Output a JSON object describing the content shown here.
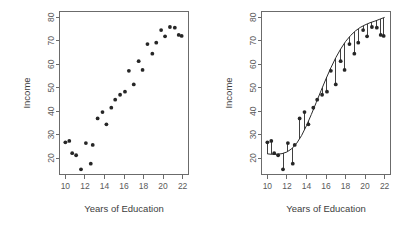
{
  "figure": {
    "background_color": "#ffffff",
    "point_color": "#262626",
    "curve_color": "#2b2b2b",
    "axis_color": "#6b6b6b",
    "label_color": "#3d3d3d"
  },
  "chart_data": [
    {
      "id": "left",
      "type": "scatter",
      "title": "",
      "xlabel": "Years of Education",
      "ylabel": "Income",
      "xlim": [
        9.4,
        22.6
      ],
      "ylim": [
        13.0,
        82.5
      ],
      "xticks": [
        10,
        12,
        14,
        16,
        18,
        20,
        22
      ],
      "yticks": [
        20,
        30,
        40,
        50,
        60,
        70,
        80
      ],
      "grid": false,
      "legend": "none",
      "x": [
        10.0,
        10.4,
        10.7,
        11.1,
        11.6,
        12.1,
        12.6,
        12.8,
        13.3,
        13.8,
        14.2,
        14.7,
        15.1,
        15.6,
        16.1,
        16.5,
        17.0,
        17.5,
        17.9,
        18.4,
        18.9,
        19.3,
        19.8,
        20.2,
        20.7,
        21.2,
        21.6,
        21.9
      ],
      "y": [
        26.7,
        27.3,
        22.1,
        21.2,
        15.2,
        26.4,
        17.6,
        25.6,
        36.9,
        39.6,
        34.4,
        41.5,
        44.9,
        47.0,
        48.3,
        57.2,
        51.4,
        61.3,
        57.6,
        68.6,
        64.5,
        69.2,
        74.6,
        71.9,
        75.9,
        75.6,
        72.5,
        72.1
      ],
      "note": "ISLR Income dataset: Income vs Years of Education"
    },
    {
      "id": "right",
      "type": "scatter",
      "title": "",
      "xlabel": "Years of Education",
      "ylabel": "Income",
      "xlim": [
        9.4,
        22.6
      ],
      "ylim": [
        13.0,
        82.5
      ],
      "xticks": [
        10,
        12,
        14,
        16,
        18,
        20,
        22
      ],
      "yticks": [
        20,
        30,
        40,
        50,
        60,
        70,
        80
      ],
      "grid": false,
      "legend": "none",
      "x": [
        10.0,
        10.4,
        10.7,
        11.1,
        11.6,
        12.1,
        12.6,
        12.8,
        13.3,
        13.8,
        14.2,
        14.7,
        15.1,
        15.6,
        16.1,
        16.5,
        17.0,
        17.5,
        17.9,
        18.4,
        18.9,
        19.3,
        19.8,
        20.2,
        20.7,
        21.2,
        21.6,
        21.9
      ],
      "y": [
        26.7,
        27.3,
        22.1,
        21.2,
        15.2,
        26.4,
        17.6,
        25.6,
        36.9,
        39.6,
        34.4,
        41.5,
        44.9,
        47.0,
        48.3,
        57.2,
        51.4,
        61.3,
        57.6,
        68.6,
        64.5,
        69.2,
        74.6,
        71.9,
        75.9,
        75.6,
        72.5,
        72.1
      ],
      "series": [
        {
          "name": "fitted curve",
          "kind": "line",
          "x": [
            10.0,
            10.5,
            11.0,
            11.5,
            12.0,
            12.5,
            13.0,
            13.5,
            14.0,
            14.5,
            15.0,
            15.5,
            16.0,
            16.5,
            17.0,
            17.5,
            18.0,
            18.5,
            19.0,
            19.5,
            20.0,
            20.5,
            21.0,
            21.5,
            22.0
          ],
          "y": [
            21.8,
            21.6,
            21.6,
            21.9,
            22.6,
            24.0,
            26.3,
            29.6,
            33.8,
            38.6,
            43.7,
            48.8,
            53.8,
            58.5,
            62.8,
            66.5,
            69.7,
            72.2,
            74.2,
            75.7,
            76.8,
            77.7,
            78.4,
            79.2,
            80.0
          ]
        }
      ],
      "residuals_shown": true,
      "note": "Same data with fitted smooth curve f(X) and vertical residual segments"
    }
  ],
  "panels": [
    {
      "name": "left",
      "axis": {
        "xlabel": "Years of Education",
        "ylabel": "Income",
        "xticks": [
          "10",
          "12",
          "14",
          "16",
          "18",
          "20",
          "22"
        ],
        "yticks": [
          "20",
          "30",
          "40",
          "50",
          "60",
          "70",
          "80"
        ]
      }
    },
    {
      "name": "right",
      "axis": {
        "xlabel": "Years of Education",
        "ylabel": "Income",
        "xticks": [
          "10",
          "12",
          "14",
          "16",
          "18",
          "20",
          "22"
        ],
        "yticks": [
          "20",
          "30",
          "40",
          "50",
          "60",
          "70",
          "80"
        ]
      }
    }
  ]
}
